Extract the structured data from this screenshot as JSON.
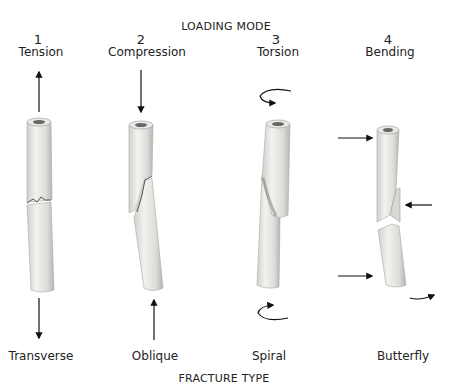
{
  "header": {
    "title": "LOADING MODE"
  },
  "footer": {
    "title": "FRACTURE TYPE"
  },
  "modes": [
    {
      "number": "1",
      "mode": "Tension",
      "fracture": "Transverse"
    },
    {
      "number": "2",
      "mode": "Compression",
      "fracture": "Oblique"
    },
    {
      "number": "3",
      "mode": "Torsion",
      "fracture": "Spiral"
    },
    {
      "number": "4",
      "mode": "Bending",
      "fracture": "Butterfly"
    }
  ],
  "colors": {
    "bone": "#e4e4e0",
    "bone_shade": "#b8b8b4",
    "arrow": "#111111"
  }
}
